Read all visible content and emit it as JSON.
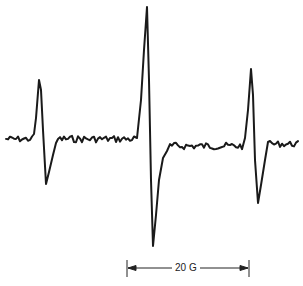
{
  "chart_data": {
    "type": "line",
    "title": "",
    "xlabel": "",
    "ylabel": "",
    "grid": false,
    "legend": null,
    "lines": [
      {
        "name": "low-field line",
        "peak_x_px": 39,
        "peak_y_px": 80,
        "trough_x_px": 46,
        "trough_y_px": 184,
        "relative_amplitude": 0.44
      },
      {
        "name": "center line",
        "peak_x_px": 147,
        "peak_y_px": 7,
        "trough_x_px": 153,
        "trough_y_px": 246,
        "relative_amplitude": 1.0
      },
      {
        "name": "high-field line",
        "peak_x_px": 251,
        "peak_y_px": 69,
        "trough_x_px": 258,
        "trough_y_px": 203,
        "relative_amplitude": 0.56
      }
    ],
    "baseline_y_px": 140,
    "scale_bar": {
      "label": "20 G",
      "x_start_px": 127,
      "x_end_px": 249,
      "y_px": 268
    },
    "trace_color": "#1a1a1a",
    "background_color": "#ffffff"
  },
  "scale_bar_label": "20 G"
}
